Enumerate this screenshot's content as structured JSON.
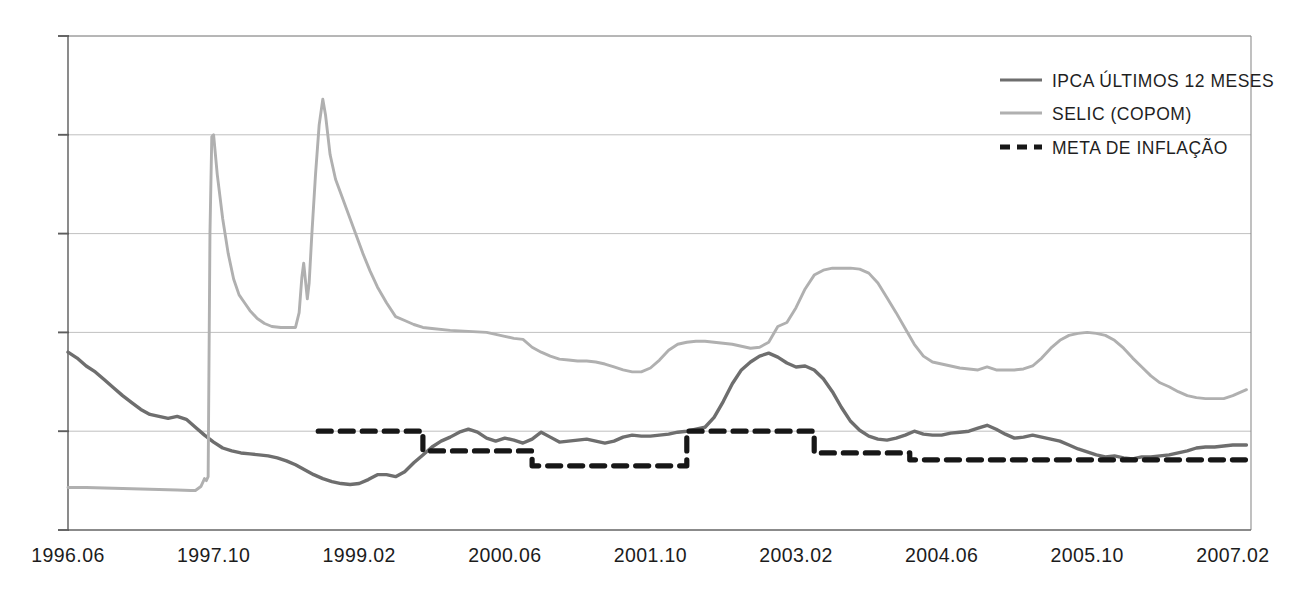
{
  "chart_data": {
    "type": "line",
    "title": "",
    "subtitle": "",
    "xlabel": "",
    "ylabel": "",
    "grid": true,
    "legend_position": "top-right",
    "xlim": [
      0,
      130
    ],
    "ylim": [
      0,
      50
    ],
    "y_gridlines": [
      0,
      10,
      20,
      30,
      40,
      50
    ],
    "y_axis_labels_visible": false,
    "x_tick_labels": [
      "1996.06",
      "1997.10",
      "1999.02",
      "2000.06",
      "2001.10",
      "2003.02",
      "2004.06",
      "2005.10",
      "2007.02"
    ],
    "x_tick_positions": [
      0,
      16,
      32,
      48,
      64,
      80,
      96,
      112,
      128
    ],
    "legend": [
      {
        "label": "IPCA ÚLTIMOS 12 MESES",
        "color": "#6e6e6e",
        "style": "solid",
        "key": "ipca"
      },
      {
        "label": "SELIC (COPOM)",
        "color": "#b0b0b0",
        "style": "solid",
        "key": "selic"
      },
      {
        "label": "META DE INFLAÇÃO",
        "color": "#171717",
        "style": "dashed",
        "key": "meta"
      }
    ],
    "series": [
      {
        "name": "IPCA ÚLTIMOS 12 MESES",
        "key": "ipca",
        "color": "#6e6e6e",
        "style": "solid",
        "width": 3.4,
        "points": [
          [
            0.0,
            18.0
          ],
          [
            1.0,
            17.4
          ],
          [
            2.0,
            16.6
          ],
          [
            3.0,
            16.0
          ],
          [
            4.0,
            15.2
          ],
          [
            5.0,
            14.4
          ],
          [
            6.0,
            13.6
          ],
          [
            7.0,
            12.9
          ],
          [
            8.0,
            12.2
          ],
          [
            9.0,
            11.7
          ],
          [
            10.0,
            11.5
          ],
          [
            11.0,
            11.3
          ],
          [
            12.0,
            11.5
          ],
          [
            13.0,
            11.2
          ],
          [
            14.0,
            10.4
          ],
          [
            15.0,
            9.6
          ],
          [
            16.0,
            8.9
          ],
          [
            17.0,
            8.3
          ],
          [
            18.0,
            8.0
          ],
          [
            19.0,
            7.8
          ],
          [
            20.0,
            7.7
          ],
          [
            21.0,
            7.6
          ],
          [
            22.0,
            7.5
          ],
          [
            23.0,
            7.3
          ],
          [
            24.0,
            7.0
          ],
          [
            25.0,
            6.6
          ],
          [
            26.0,
            6.1
          ],
          [
            27.0,
            5.6
          ],
          [
            28.0,
            5.2
          ],
          [
            29.0,
            4.9
          ],
          [
            30.0,
            4.7
          ],
          [
            31.0,
            4.6
          ],
          [
            32.0,
            4.7
          ],
          [
            33.0,
            5.1
          ],
          [
            34.0,
            5.6
          ],
          [
            35.0,
            5.6
          ],
          [
            36.0,
            5.4
          ],
          [
            37.0,
            5.9
          ],
          [
            38.0,
            6.8
          ],
          [
            39.0,
            7.6
          ],
          [
            40.0,
            8.4
          ],
          [
            41.0,
            9.0
          ],
          [
            42.0,
            9.4
          ],
          [
            43.0,
            9.9
          ],
          [
            44.0,
            10.2
          ],
          [
            45.0,
            9.9
          ],
          [
            46.0,
            9.3
          ],
          [
            47.0,
            9.0
          ],
          [
            48.0,
            9.3
          ],
          [
            49.0,
            9.1
          ],
          [
            50.0,
            8.8
          ],
          [
            51.0,
            9.2
          ],
          [
            52.0,
            9.9
          ],
          [
            53.0,
            9.4
          ],
          [
            54.0,
            8.9
          ],
          [
            55.0,
            9.0
          ],
          [
            56.0,
            9.1
          ],
          [
            57.0,
            9.2
          ],
          [
            58.0,
            9.0
          ],
          [
            59.0,
            8.8
          ],
          [
            60.0,
            9.0
          ],
          [
            61.0,
            9.4
          ],
          [
            62.0,
            9.6
          ],
          [
            63.0,
            9.5
          ],
          [
            64.0,
            9.5
          ],
          [
            65.0,
            9.6
          ],
          [
            66.0,
            9.7
          ],
          [
            67.0,
            9.9
          ],
          [
            68.0,
            10.0
          ],
          [
            69.0,
            10.2
          ],
          [
            70.0,
            10.4
          ],
          [
            71.0,
            11.4
          ],
          [
            72.0,
            13.0
          ],
          [
            73.0,
            14.8
          ],
          [
            74.0,
            16.2
          ],
          [
            75.0,
            17.0
          ],
          [
            76.0,
            17.6
          ],
          [
            77.0,
            17.9
          ],
          [
            78.0,
            17.5
          ],
          [
            79.0,
            16.9
          ],
          [
            80.0,
            16.5
          ],
          [
            81.0,
            16.6
          ],
          [
            82.0,
            16.2
          ],
          [
            83.0,
            15.3
          ],
          [
            84.0,
            14.0
          ],
          [
            85.0,
            12.4
          ],
          [
            86.0,
            11.0
          ],
          [
            87.0,
            10.1
          ],
          [
            88.0,
            9.5
          ],
          [
            89.0,
            9.2
          ],
          [
            90.0,
            9.1
          ],
          [
            91.0,
            9.3
          ],
          [
            92.0,
            9.6
          ],
          [
            93.0,
            10.0
          ],
          [
            94.0,
            9.7
          ],
          [
            95.0,
            9.6
          ],
          [
            96.0,
            9.6
          ],
          [
            97.0,
            9.8
          ],
          [
            98.0,
            9.9
          ],
          [
            99.0,
            10.0
          ],
          [
            100.0,
            10.3
          ],
          [
            101.0,
            10.6
          ],
          [
            102.0,
            10.2
          ],
          [
            103.0,
            9.7
          ],
          [
            104.0,
            9.3
          ],
          [
            105.0,
            9.4
          ],
          [
            106.0,
            9.6
          ],
          [
            107.0,
            9.4
          ],
          [
            108.0,
            9.2
          ],
          [
            109.0,
            9.0
          ],
          [
            110.0,
            8.6
          ],
          [
            111.0,
            8.2
          ],
          [
            112.0,
            7.9
          ],
          [
            113.0,
            7.6
          ],
          [
            114.0,
            7.4
          ],
          [
            115.0,
            7.5
          ],
          [
            116.0,
            7.3
          ],
          [
            117.0,
            7.2
          ],
          [
            118.0,
            7.4
          ],
          [
            119.0,
            7.4
          ],
          [
            120.0,
            7.5
          ],
          [
            121.0,
            7.6
          ],
          [
            122.0,
            7.8
          ],
          [
            123.0,
            8.0
          ],
          [
            124.0,
            8.3
          ],
          [
            125.0,
            8.4
          ],
          [
            126.0,
            8.4
          ],
          [
            127.0,
            8.5
          ],
          [
            128.0,
            8.6
          ],
          [
            129.5,
            8.6
          ]
        ]
      },
      {
        "name": "SELIC (COPOM)",
        "key": "selic",
        "color": "#b0b0b0",
        "style": "solid",
        "width": 2.9,
        "points": [
          [
            0.0,
            4.3
          ],
          [
            2.0,
            4.3
          ],
          [
            4.0,
            4.25
          ],
          [
            6.0,
            4.2
          ],
          [
            8.0,
            4.15
          ],
          [
            10.0,
            4.1
          ],
          [
            12.0,
            4.05
          ],
          [
            13.5,
            4.0
          ],
          [
            14.0,
            4.0
          ],
          [
            14.6,
            4.4
          ],
          [
            15.0,
            5.2
          ],
          [
            15.2,
            5.0
          ],
          [
            15.4,
            5.4
          ],
          [
            15.6,
            30.0
          ],
          [
            15.8,
            39.8
          ],
          [
            16.0,
            40.0
          ],
          [
            16.4,
            36.0
          ],
          [
            17.0,
            31.5
          ],
          [
            17.6,
            28.0
          ],
          [
            18.2,
            25.4
          ],
          [
            18.8,
            23.8
          ],
          [
            19.4,
            23.0
          ],
          [
            20.0,
            22.2
          ],
          [
            20.8,
            21.4
          ],
          [
            21.6,
            20.9
          ],
          [
            22.4,
            20.6
          ],
          [
            23.4,
            20.5
          ],
          [
            24.4,
            20.5
          ],
          [
            25.0,
            20.5
          ],
          [
            25.4,
            22.0
          ],
          [
            25.7,
            25.6
          ],
          [
            25.9,
            27.0
          ],
          [
            26.1,
            25.2
          ],
          [
            26.3,
            23.4
          ],
          [
            26.5,
            25.0
          ],
          [
            26.8,
            30.0
          ],
          [
            27.2,
            36.0
          ],
          [
            27.6,
            41.0
          ],
          [
            28.0,
            43.6
          ],
          [
            28.3,
            42.0
          ],
          [
            28.8,
            38.0
          ],
          [
            29.4,
            35.5
          ],
          [
            30.0,
            34.0
          ],
          [
            30.8,
            32.0
          ],
          [
            31.6,
            30.0
          ],
          [
            32.4,
            28.0
          ],
          [
            33.2,
            26.2
          ],
          [
            34.0,
            24.6
          ],
          [
            35.0,
            23.0
          ],
          [
            36.0,
            21.6
          ],
          [
            37.0,
            21.2
          ],
          [
            38.0,
            20.8
          ],
          [
            39.0,
            20.5
          ],
          [
            40.0,
            20.4
          ],
          [
            42.0,
            20.2
          ],
          [
            44.0,
            20.1
          ],
          [
            46.0,
            20.0
          ],
          [
            47.0,
            19.8
          ],
          [
            48.0,
            19.6
          ],
          [
            49.0,
            19.4
          ],
          [
            50.0,
            19.3
          ],
          [
            51.0,
            18.5
          ],
          [
            52.0,
            18.0
          ],
          [
            53.0,
            17.6
          ],
          [
            54.0,
            17.3
          ],
          [
            55.0,
            17.2
          ],
          [
            56.0,
            17.1
          ],
          [
            57.0,
            17.1
          ],
          [
            58.0,
            17.0
          ],
          [
            59.0,
            16.8
          ],
          [
            60.0,
            16.5
          ],
          [
            61.0,
            16.2
          ],
          [
            62.0,
            16.0
          ],
          [
            63.0,
            16.0
          ],
          [
            64.0,
            16.4
          ],
          [
            65.0,
            17.2
          ],
          [
            66.0,
            18.2
          ],
          [
            67.0,
            18.8
          ],
          [
            68.0,
            19.0
          ],
          [
            69.0,
            19.1
          ],
          [
            70.0,
            19.1
          ],
          [
            71.0,
            19.0
          ],
          [
            72.0,
            18.9
          ],
          [
            73.0,
            18.8
          ],
          [
            74.0,
            18.6
          ],
          [
            75.0,
            18.4
          ],
          [
            76.0,
            18.5
          ],
          [
            77.0,
            19.0
          ],
          [
            78.0,
            20.6
          ],
          [
            79.0,
            21.0
          ],
          [
            80.0,
            22.5
          ],
          [
            81.0,
            24.4
          ],
          [
            82.0,
            25.8
          ],
          [
            83.0,
            26.3
          ],
          [
            84.0,
            26.5
          ],
          [
            85.0,
            26.5
          ],
          [
            86.0,
            26.5
          ],
          [
            87.0,
            26.4
          ],
          [
            88.0,
            26.0
          ],
          [
            89.0,
            25.0
          ],
          [
            90.0,
            23.5
          ],
          [
            91.0,
            22.0
          ],
          [
            92.0,
            20.4
          ],
          [
            93.0,
            18.8
          ],
          [
            94.0,
            17.6
          ],
          [
            95.0,
            17.0
          ],
          [
            96.0,
            16.8
          ],
          [
            97.0,
            16.6
          ],
          [
            98.0,
            16.4
          ],
          [
            99.0,
            16.3
          ],
          [
            100.0,
            16.2
          ],
          [
            101.0,
            16.5
          ],
          [
            102.0,
            16.2
          ],
          [
            103.0,
            16.2
          ],
          [
            104.0,
            16.2
          ],
          [
            105.0,
            16.3
          ],
          [
            106.0,
            16.6
          ],
          [
            107.0,
            17.4
          ],
          [
            108.0,
            18.4
          ],
          [
            109.0,
            19.2
          ],
          [
            110.0,
            19.7
          ],
          [
            111.0,
            19.9
          ],
          [
            112.0,
            20.0
          ],
          [
            113.0,
            19.9
          ],
          [
            114.0,
            19.7
          ],
          [
            115.0,
            19.2
          ],
          [
            116.0,
            18.4
          ],
          [
            117.0,
            17.4
          ],
          [
            118.0,
            16.5
          ],
          [
            119.0,
            15.6
          ],
          [
            120.0,
            14.9
          ],
          [
            121.0,
            14.5
          ],
          [
            122.0,
            14.0
          ],
          [
            123.0,
            13.6
          ],
          [
            124.0,
            13.4
          ],
          [
            125.0,
            13.3
          ],
          [
            126.0,
            13.3
          ],
          [
            127.0,
            13.3
          ],
          [
            128.0,
            13.6
          ],
          [
            129.5,
            14.2
          ]
        ]
      },
      {
        "name": "META DE INFLAÇÃO",
        "key": "meta",
        "color": "#171717",
        "style": "dashed",
        "width": 5.2,
        "dash": "13,9",
        "points": [
          [
            27.5,
            10.0
          ],
          [
            39.0,
            10.0
          ],
          [
            39.0,
            8.0
          ],
          [
            51.0,
            8.0
          ],
          [
            51.0,
            6.5
          ],
          [
            68.0,
            6.5
          ],
          [
            68.0,
            10.0
          ],
          [
            82.0,
            10.0
          ],
          [
            82.0,
            7.8
          ],
          [
            92.5,
            7.8
          ],
          [
            92.5,
            7.1
          ],
          [
            129.5,
            7.1
          ]
        ]
      }
    ]
  },
  "plot": {
    "left": 68,
    "right": 1251,
    "top": 36,
    "bottom": 530
  },
  "legend_box": {
    "line_x1": 1000,
    "line_x2": 1042,
    "text_x": 1052,
    "rows_y": [
      80,
      113,
      147
    ]
  }
}
